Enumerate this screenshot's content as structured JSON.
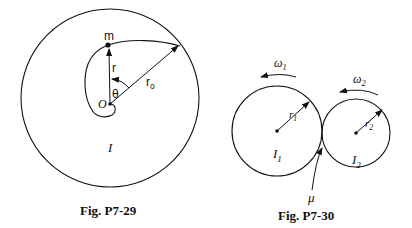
{
  "figures": [
    {
      "caption": "Fig.  P7-29",
      "labels": {
        "mass": "m",
        "radius": "r",
        "outer_radius": "r",
        "outer_radius_sub": "o",
        "angle": "θ",
        "origin": "O",
        "inertia": "I"
      }
    },
    {
      "caption": "Fig.  P7-30",
      "labels": {
        "omega1": "ω",
        "omega1_sub": "1",
        "omega2": "ω",
        "omega2_sub": "2",
        "r1": "r",
        "r1_sub": "1",
        "r2": "r",
        "r2_sub": "2",
        "inertia1": "I",
        "inertia1_sub": "1",
        "inertia2": "I",
        "inertia2_sub": "2",
        "friction": "μ"
      }
    }
  ],
  "colors": {
    "ink": "#111111",
    "background": "#ffffff"
  }
}
